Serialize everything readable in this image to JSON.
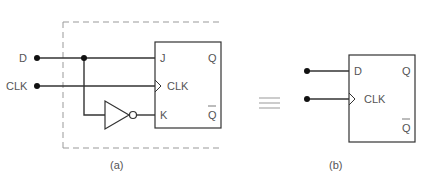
{
  "figure_a": {
    "inputs": [
      "D",
      "CLK"
    ],
    "ff_pins_left": [
      "J",
      "CLK",
      "K"
    ],
    "ff_pins_right": [
      "Q",
      "Q"
    ],
    "caption": "(a)"
  },
  "equivalence_symbol": "≡",
  "figure_b": {
    "ff_pins_left": [
      "D",
      "CLK"
    ],
    "ff_pins_right": [
      "Q",
      "Q"
    ],
    "caption": "(b)"
  },
  "colors": {
    "line": "#333333",
    "dashed": "#999999",
    "text": "#555555"
  }
}
